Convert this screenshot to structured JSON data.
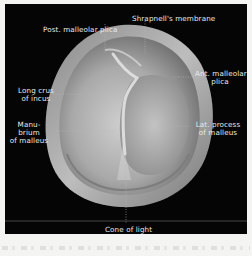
{
  "figure": {
    "background_color": "#050505",
    "border_color": "#f4f4f2",
    "label_color": "#e8e8e8",
    "labels": {
      "post_malleolar_plica": "Post. malleolar plica",
      "shrapnells_membrane": "Shrapnell's membrane",
      "ant_malleolar_plica_1": "Ant. malleolar",
      "ant_malleolar_plica_2": "plica",
      "long_crus_1": "Long crus",
      "long_crus_2": "of incus",
      "manubrium_1": "Manu-",
      "manubrium_2": "brium",
      "manubrium_3": "of malleus",
      "lat_process_1": "Lat. process",
      "lat_process_2": "of malleus",
      "cone_of_light": "Cone of light"
    }
  }
}
